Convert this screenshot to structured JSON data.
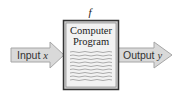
{
  "diagram": {
    "function_label": "f",
    "box": {
      "title_line1": "Computer",
      "title_line2": "Program",
      "text_lines": 9
    },
    "input_arrow": {
      "label": "Input",
      "variable": "x"
    },
    "output_arrow": {
      "label": "Output",
      "variable": "y"
    },
    "colors": {
      "arrow_fill": "#d9d9d9",
      "arrow_stroke": "#a6a6a6",
      "box_fill": "#f2f2f2",
      "box_border": "#333333",
      "squiggle": "#8c8c8c"
    }
  }
}
